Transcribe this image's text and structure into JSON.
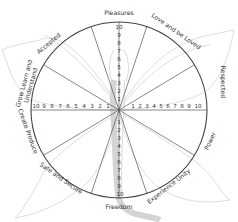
{
  "diagram": {
    "center": [
      119,
      110
    ],
    "radius": 88,
    "scale": [
      1,
      2,
      3,
      4,
      5,
      6,
      7,
      8,
      9,
      10
    ],
    "colors": {
      "circle": "#444444",
      "spokes": "#555555",
      "text": "#333333",
      "outline": "#c8c8c8",
      "spine": "#b0b0b0"
    },
    "labels": {
      "top": "Pleasures",
      "top_right": "Love and be Loved",
      "right_upper": "Respected",
      "right_lower": "Power",
      "bottom_right": "Experience Unity",
      "bottom": "Freedom",
      "bottom_left": "Safe and Secure",
      "left_lower": "Create Produce",
      "left_upper_1": "Grow Learn and",
      "left_upper_2": "Understand",
      "top_left": "Accepted"
    }
  }
}
